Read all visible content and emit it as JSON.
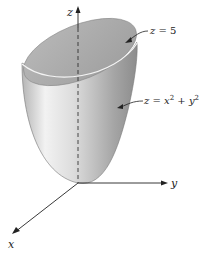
{
  "figure": {
    "axes": {
      "z_label": "z",
      "y_label": "y",
      "x_label": "x"
    },
    "annotations": {
      "plane": {
        "lhs": "z",
        "eq": "=",
        "rhs": "5"
      },
      "paraboloid": {
        "lhs": "z",
        "eq": "=",
        "x": "x",
        "x_exp": "2",
        "plus": "+",
        "y": "y",
        "y_exp": "2"
      }
    },
    "colors": {
      "surface_light": "#e8e8e8",
      "surface_dark": "#8a8a8a",
      "top_cap": "#a9a9a9",
      "axis": "#222222"
    }
  }
}
